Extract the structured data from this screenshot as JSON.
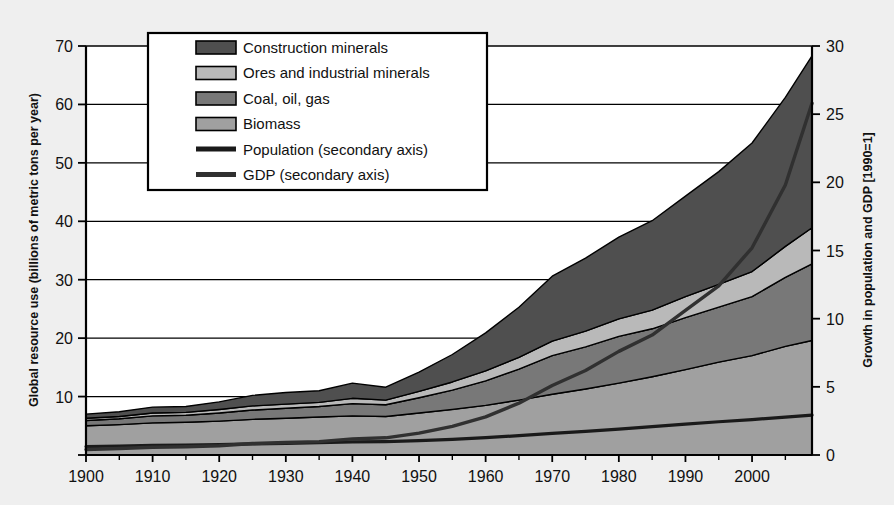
{
  "figure": {
    "background_color": "#efefef",
    "plot_background_color": "#ffffff",
    "axis_color": "#000000"
  },
  "chart_data": {
    "type": "area",
    "title": "",
    "subtitle": "",
    "stacked": true,
    "grid": true,
    "legend_position": "top-left-inside",
    "xlabel": "",
    "ylabel": "Global resource use (billions of metric tons per year)",
    "y2label": "Growth in population and GDP [1990=1]",
    "xlim": [
      1900,
      2009
    ],
    "ylim": [
      0,
      70
    ],
    "y2lim": [
      0,
      30
    ],
    "xticks": [
      1900,
      1910,
      1920,
      1930,
      1940,
      1950,
      1960,
      1970,
      1980,
      1990,
      2000
    ],
    "xticklabels": [
      "1900",
      "1910",
      "1920",
      "1930",
      "1940",
      "1950",
      "1960",
      "1970",
      "1980",
      "1990",
      "2000"
    ],
    "yticks": [
      0,
      10,
      20,
      30,
      40,
      50,
      60,
      70
    ],
    "yticklabels": [
      "",
      "10",
      "20",
      "30",
      "40",
      "50",
      "60",
      "70"
    ],
    "y2ticks": [
      0,
      5,
      10,
      15,
      20,
      25,
      30
    ],
    "y2ticklabels": [
      "0",
      "5",
      "10",
      "15",
      "20",
      "25",
      "30"
    ],
    "x": [
      1900,
      1905,
      1910,
      1915,
      1920,
      1925,
      1930,
      1935,
      1940,
      1945,
      1950,
      1955,
      1960,
      1965,
      1970,
      1975,
      1980,
      1985,
      1990,
      1995,
      2000,
      2005,
      2009
    ],
    "series": [
      {
        "name": "Biomass",
        "axis": "primary",
        "color": "#a0a0a0",
        "values": [
          5.0,
          5.2,
          5.5,
          5.6,
          5.8,
          6.1,
          6.3,
          6.5,
          6.7,
          6.6,
          7.2,
          7.8,
          8.5,
          9.4,
          10.4,
          11.3,
          12.3,
          13.4,
          14.6,
          15.9,
          17.0,
          18.6,
          19.6
        ]
      },
      {
        "name": "Coal, oil, gas",
        "axis": "primary",
        "color": "#787878",
        "values": [
          0.9,
          1.0,
          1.2,
          1.2,
          1.4,
          1.6,
          1.7,
          1.8,
          2.1,
          2.0,
          2.6,
          3.3,
          4.2,
          5.3,
          6.6,
          7.2,
          8.0,
          8.2,
          8.9,
          9.4,
          10.1,
          11.8,
          13.1
        ]
      },
      {
        "name": "Ores and industrial minerals",
        "axis": "primary",
        "color": "#b9b9b9",
        "values": [
          0.4,
          0.4,
          0.5,
          0.5,
          0.6,
          0.7,
          0.7,
          0.7,
          0.9,
          0.8,
          1.1,
          1.4,
          1.7,
          2.0,
          2.5,
          2.7,
          3.0,
          3.2,
          3.6,
          3.9,
          4.3,
          5.3,
          6.2
        ]
      },
      {
        "name": "Construction minerals",
        "axis": "primary",
        "color": "#4f4f4f",
        "values": [
          0.7,
          0.8,
          1.0,
          1.0,
          1.3,
          1.8,
          2.0,
          2.0,
          2.6,
          2.2,
          3.3,
          4.7,
          6.5,
          8.6,
          11.1,
          12.5,
          14.0,
          15.3,
          17.2,
          19.3,
          22.0,
          25.5,
          29.4
        ]
      },
      {
        "name": "Population (secondary axis)",
        "axis": "secondary",
        "color": "#1a1a1a",
        "line_width": 3.2,
        "values": [
          0.62,
          0.66,
          0.7,
          0.73,
          0.76,
          0.81,
          0.86,
          0.91,
          0.96,
          0.98,
          1.05,
          1.15,
          1.27,
          1.42,
          1.58,
          1.74,
          1.9,
          2.08,
          2.26,
          2.44,
          2.6,
          2.78,
          2.92
        ]
      },
      {
        "name": "GDP (secondary axis)",
        "axis": "secondary",
        "color": "#303030",
        "line_width": 3.4,
        "values": [
          0.4,
          0.48,
          0.57,
          0.6,
          0.68,
          0.84,
          0.92,
          0.98,
          1.18,
          1.26,
          1.6,
          2.1,
          2.8,
          3.8,
          5.1,
          6.2,
          7.6,
          8.8,
          10.6,
          12.4,
          15.2,
          19.8,
          25.8
        ]
      }
    ]
  },
  "legend": {
    "items": [
      {
        "label": "Construction minerals",
        "swatch": "patch",
        "color": "#4f4f4f"
      },
      {
        "label": "Ores and industrial minerals",
        "swatch": "patch",
        "color": "#b9b9b9"
      },
      {
        "label": "Coal, oil, gas",
        "swatch": "patch",
        "color": "#787878"
      },
      {
        "label": "Biomass",
        "swatch": "patch",
        "color": "#a0a0a0"
      },
      {
        "label": "Population (secondary axis)",
        "swatch": "line",
        "color": "#1a1a1a"
      },
      {
        "label": "GDP (secondary axis)",
        "swatch": "line",
        "color": "#303030"
      }
    ]
  }
}
